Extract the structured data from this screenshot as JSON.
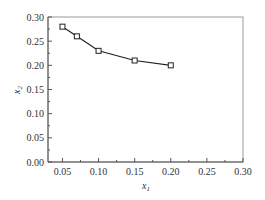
{
  "chart_data": {
    "type": "line",
    "title": "",
    "xlabel": "x1",
    "ylabel": "x2",
    "xlabel_main": "x",
    "xlabel_sub": "1",
    "ylabel_main": "x",
    "ylabel_sub": "2",
    "xlim": [
      0.03,
      0.3
    ],
    "ylim": [
      0.0,
      0.3
    ],
    "grid": false,
    "legend": null,
    "x_ticks": [
      0.05,
      0.1,
      0.15,
      0.2,
      0.25,
      0.3
    ],
    "x_tick_labels": [
      "0.05",
      "0.10",
      "0.15",
      "0.20",
      "0.25",
      "0.30"
    ],
    "y_ticks": [
      0.0,
      0.05,
      0.1,
      0.15,
      0.2,
      0.25,
      0.3
    ],
    "y_tick_labels": [
      "0.00",
      "0.05",
      "0.10",
      "0.15",
      "0.20",
      "0.25",
      "0.30"
    ],
    "series": [
      {
        "name": "x2 vs x1",
        "marker": "open-square",
        "color": "#222222",
        "x": [
          0.05,
          0.07,
          0.1,
          0.15,
          0.2
        ],
        "y": [
          0.28,
          0.26,
          0.23,
          0.21,
          0.2
        ]
      }
    ]
  },
  "colors": {
    "frame": "#999999",
    "line": "#222222",
    "text": "#333333"
  }
}
